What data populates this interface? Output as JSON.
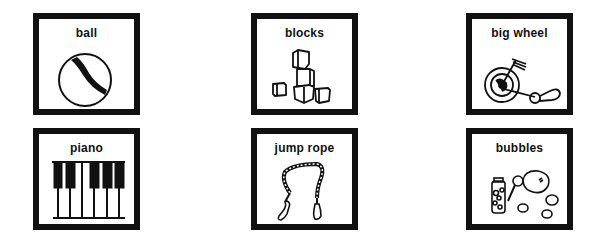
{
  "cards": [
    {
      "label": "ball",
      "icon": "ball-icon"
    },
    {
      "label": "blocks",
      "icon": "blocks-icon"
    },
    {
      "label": "big wheel",
      "icon": "big-wheel-icon"
    },
    {
      "label": "piano",
      "icon": "piano-icon"
    },
    {
      "label": "jump rope",
      "icon": "jump-rope-icon"
    },
    {
      "label": "bubbles",
      "icon": "bubbles-icon"
    }
  ]
}
